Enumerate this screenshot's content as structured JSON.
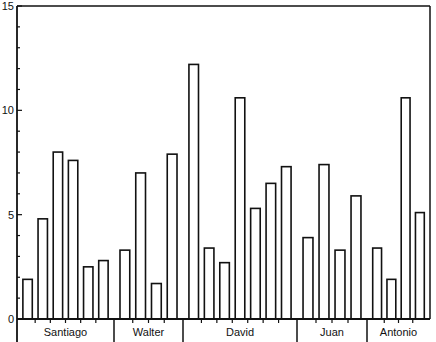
{
  "chart_data": {
    "type": "bar",
    "title": "",
    "xlabel": "",
    "ylabel": "",
    "ylim": [
      0,
      15
    ],
    "yticks": [
      0,
      5,
      10,
      15
    ],
    "y_minor_tick_step": 1,
    "grid": false,
    "legend": null,
    "bar_style": {
      "fill": "#ffffff",
      "stroke": "#111111"
    },
    "groups": [
      {
        "name": "Santiago",
        "values": [
          1.9,
          4.8,
          8.0,
          7.6,
          2.5,
          2.8
        ]
      },
      {
        "name": "Walter",
        "values": [
          3.3,
          7.0,
          1.7,
          7.9
        ]
      },
      {
        "name": "David",
        "values": [
          12.2,
          3.4,
          2.7,
          10.6,
          5.3,
          6.5,
          7.3
        ]
      },
      {
        "name": "Juan",
        "values": [
          3.9,
          7.4,
          3.3,
          5.9
        ]
      },
      {
        "name": "Antonio",
        "values": [
          3.4,
          1.9,
          10.6,
          5.1
        ]
      }
    ]
  }
}
